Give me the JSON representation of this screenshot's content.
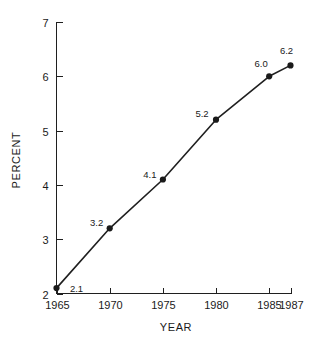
{
  "chart_data": {
    "type": "line",
    "title": "",
    "subtitle": "",
    "xlabel": "YEAR",
    "ylabel": "PERCENT",
    "x": [
      1965,
      1970,
      1975,
      1980,
      1985,
      1987
    ],
    "values": [
      2.1,
      3.2,
      4.1,
      5.2,
      6.0,
      6.2
    ],
    "point_labels": [
      "2.1",
      "3.2",
      "4.1",
      "5.2",
      "6.0",
      "6.2"
    ],
    "xticks": [
      1965,
      1970,
      1975,
      1980,
      1985,
      1987
    ],
    "xtick_labels": [
      "1965",
      "1970",
      "1975",
      "1980",
      "1985",
      "1987"
    ],
    "yticks": [
      2,
      3,
      4,
      5,
      6,
      7
    ],
    "ytick_labels": [
      "2",
      "3",
      "4",
      "5",
      "6",
      "7"
    ],
    "xlim": [
      1965,
      1987
    ],
    "ylim": [
      2,
      7
    ],
    "grid": false,
    "legend": false,
    "legend_position": "none",
    "series": [
      {
        "name": "percent",
        "values": [
          2.1,
          3.2,
          4.1,
          5.2,
          6.0,
          6.2
        ],
        "marker": "filled-circle",
        "color": "#1a1a1a"
      }
    ],
    "colors": {
      "line": "#1f1f1f",
      "marker": "#1a1a1a",
      "axis": "#1f1f1f",
      "text": "#1a1a1a",
      "background": "#ffffff"
    }
  }
}
